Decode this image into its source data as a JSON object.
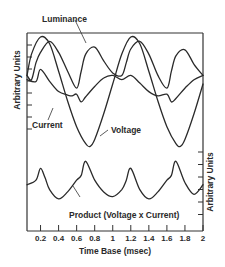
{
  "chart_data": {
    "type": "line",
    "title": "",
    "xlabel": "Time Base (msec)",
    "ylabel_left": "Arbitrary Units",
    "ylabel_right": "Arbitrary Units",
    "xlim": [
      0.05,
      2.0
    ],
    "x_ticks": [
      "0.2",
      "0.4",
      "0.6",
      "0.8",
      "1",
      "1.2",
      "1.4",
      "1.6",
      "1.8",
      "2"
    ],
    "grid": false,
    "legend": "inline annotations",
    "panels": [
      {
        "name": "upper",
        "series": [
          {
            "name": "Luminance",
            "x": [
              0.05,
              0.1,
              0.15,
              0.2,
              0.3,
              0.4,
              0.5,
              0.6,
              0.65,
              0.7,
              0.8,
              0.9,
              1.0,
              1.1,
              1.15,
              1.2,
              1.3,
              1.4,
              1.5,
              1.6,
              1.65,
              1.7,
              1.8,
              1.9,
              2.0
            ],
            "y": [
              0.55,
              0.5,
              0.7,
              0.82,
              0.95,
              0.82,
              0.6,
              0.4,
              0.6,
              0.8,
              0.88,
              0.72,
              0.58,
              0.55,
              0.7,
              0.86,
              0.95,
              0.8,
              0.55,
              0.4,
              0.6,
              0.78,
              0.85,
              0.68,
              0.55
            ]
          },
          {
            "name": "Current",
            "x": [
              0.05,
              0.15,
              0.2,
              0.3,
              0.4,
              0.5,
              0.55,
              0.6,
              0.65,
              0.7,
              0.8,
              0.9,
              1.0,
              1.1,
              1.2,
              1.3,
              1.4,
              1.5,
              1.6,
              1.65,
              1.7,
              1.8,
              1.9,
              2.0
            ],
            "y": [
              0.5,
              0.48,
              0.62,
              0.48,
              0.36,
              0.32,
              0.31,
              0.33,
              0.24,
              0.3,
              0.42,
              0.52,
              0.55,
              0.5,
              0.55,
              0.46,
              0.36,
              0.31,
              0.33,
              0.24,
              0.28,
              0.4,
              0.5,
              0.55
            ]
          },
          {
            "name": "Voltage",
            "x": [
              0.05,
              0.1,
              0.2,
              0.3,
              0.4,
              0.5,
              0.6,
              0.7,
              0.75,
              0.8,
              0.9,
              1.0,
              1.1,
              1.2,
              1.3,
              1.4,
              1.5,
              1.6,
              1.7,
              1.75,
              1.8,
              1.9,
              2.0
            ],
            "y": [
              0.55,
              0.8,
              1.0,
              0.92,
              0.6,
              0.25,
              -0.05,
              -0.25,
              -0.28,
              -0.2,
              0.1,
              0.45,
              0.8,
              1.0,
              0.92,
              0.6,
              0.25,
              -0.05,
              -0.25,
              -0.28,
              -0.2,
              0.1,
              0.45
            ]
          }
        ]
      },
      {
        "name": "lower",
        "series": [
          {
            "name": "Product (Voltage x Current)",
            "x": [
              0.05,
              0.15,
              0.2,
              0.25,
              0.3,
              0.4,
              0.5,
              0.6,
              0.65,
              0.7,
              0.8,
              0.9,
              1.0,
              1.1,
              1.15,
              1.2,
              1.3,
              1.4,
              1.5,
              1.6,
              1.65,
              1.7,
              1.8,
              1.9,
              2.0
            ],
            "y": [
              0.45,
              0.55,
              0.8,
              0.6,
              0.35,
              0.15,
              0.3,
              0.55,
              0.65,
              0.95,
              0.55,
              0.3,
              0.2,
              0.35,
              0.55,
              0.8,
              0.35,
              0.15,
              0.3,
              0.55,
              0.65,
              0.95,
              0.5,
              0.25,
              0.45
            ]
          }
        ]
      }
    ],
    "annotations": [
      "Luminance",
      "Current",
      "Voltage",
      "Product (Voltage x Current)"
    ]
  },
  "labels": {
    "luminance": "Luminance",
    "current": "Current",
    "voltage": "Voltage",
    "product": "Product (Voltage x Current)",
    "xlabel": "Time Base (msec)",
    "ylabel_left": "Arbitrary Units",
    "ylabel_right": "Arbitrary Units",
    "xticks": [
      "0.2",
      "0.4",
      "0.6",
      "0.8",
      "1",
      "1.2",
      "1.4",
      "1.6",
      "1.8",
      "2"
    ]
  }
}
